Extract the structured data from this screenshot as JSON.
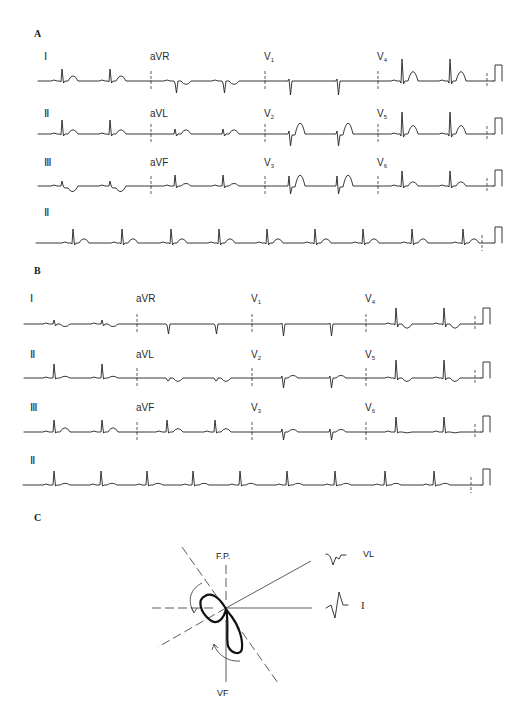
{
  "panels": [
    {
      "letter": "A",
      "letter_pos": [
        34,
        37
      ],
      "segments_x": [
        38,
        151,
        265,
        378,
        493
      ],
      "calibration_x": 493,
      "rows": [
        {
          "baseline_y": 81,
          "label_y": 60,
          "leads": [
            "I",
            "aVR",
            "V1",
            "V4"
          ],
          "morph": [
            "I_A",
            "aVR_A",
            "V1_A",
            "V4_A"
          ]
        },
        {
          "baseline_y": 134,
          "label_y": 117,
          "leads": [
            "II",
            "aVL",
            "V2",
            "V5"
          ],
          "morph": [
            "II_A",
            "aVL_A",
            "V2_A",
            "V5_A"
          ]
        },
        {
          "baseline_y": 186,
          "label_y": 166,
          "leads": [
            "III",
            "aVF",
            "V3",
            "V6"
          ],
          "morph": [
            "III_A",
            "aVF_A",
            "V3_A",
            "V6_A"
          ]
        }
      ],
      "rhythm": {
        "lead": "II",
        "label_y": 216,
        "baseline_y": 243,
        "x_start": 36,
        "x_end": 493,
        "beats": [
          73,
          122,
          171,
          219,
          267,
          315,
          363,
          412,
          463
        ],
        "morph": "II_A",
        "marker_x": 482
      },
      "beat_offsets": [
        24,
        72
      ]
    },
    {
      "letter": "B",
      "letter_pos": [
        34,
        274
      ],
      "segments_x": [
        24,
        137,
        252,
        366,
        481
      ],
      "calibration_x": 481,
      "rows": [
        {
          "baseline_y": 324,
          "label_y": 302,
          "leads": [
            "I",
            "aVR",
            "V1",
            "V4"
          ],
          "morph": [
            "I_B",
            "aVR_B",
            "V1_B",
            "V4_B"
          ]
        },
        {
          "baseline_y": 378,
          "label_y": 358,
          "leads": [
            "II",
            "aVL",
            "V2",
            "V5"
          ],
          "morph": [
            "II_B",
            "aVL_B",
            "V2_B",
            "V5_B"
          ]
        },
        {
          "baseline_y": 432,
          "label_y": 411,
          "leads": [
            "III",
            "aVF",
            "V3",
            "V6"
          ],
          "morph": [
            "III_B",
            "aVF_B",
            "V3_B",
            "V6_B"
          ]
        }
      ],
      "rhythm": {
        "lead": "II",
        "label_y": 464,
        "baseline_y": 485,
        "x_start": 23,
        "x_end": 481,
        "beats": [
          54,
          101,
          147,
          193,
          240,
          287,
          335,
          385,
          434
        ],
        "morph": "II_B",
        "marker_x": 471
      },
      "beat_offsets": [
        30,
        78
      ]
    }
  ],
  "diagram": {
    "letter": "C",
    "letter_pos": [
      34,
      521
    ],
    "center": [
      226,
      609
    ],
    "top_label": "F.P.",
    "bottom_label": "VF",
    "lead_labels": [
      {
        "text": "VL",
        "complex": "VL",
        "x": 328,
        "y": 557
      },
      {
        "text": "I",
        "complex": "I",
        "x": 328,
        "y": 608
      }
    ]
  }
}
